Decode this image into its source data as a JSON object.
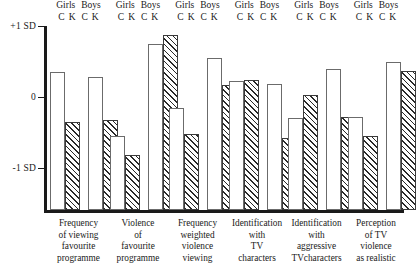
{
  "chart_data": {
    "type": "bar",
    "title": "",
    "xlabel": "",
    "ylabel": "",
    "ylim": [
      -1.6,
      1.0
    ],
    "grid": false,
    "legend_position": "top-per-group",
    "y_ticks": [
      {
        "value": 1,
        "label": "+1 SD"
      },
      {
        "value": 0,
        "label": "0"
      },
      {
        "value": -1,
        "label": "-1 SD"
      }
    ],
    "group_header_line1": [
      "Girls",
      "Boys"
    ],
    "group_header_line2": [
      "C",
      "K",
      "C",
      "K"
    ],
    "bar_labels": [
      "Girls C",
      "Girls K",
      "Boys C",
      "Boys K"
    ],
    "bar_styles": [
      "open",
      "hatched",
      "open",
      "hatched"
    ],
    "categories": [
      "Frequency of viewing favourite programme",
      "Violence of favourite programme",
      "Frequency weighted violence viewing",
      "Identification with TV characters",
      "Identification with aggressive TVcharacters",
      "Perception of TV violence as realistic"
    ],
    "category_lines": [
      [
        "Frequency",
        "of viewing",
        "favourite",
        "programme"
      ],
      [
        "Violence",
        "of",
        "favourite",
        "programme"
      ],
      [
        "Frequency",
        "weighted",
        "violence",
        "viewing"
      ],
      [
        "Identification",
        "with",
        "TV",
        "characters"
      ],
      [
        "Identification",
        "with",
        "aggressive",
        "TVcharacters"
      ],
      [
        "Perception",
        "of TV",
        "violence",
        "as realistic"
      ]
    ],
    "series": [
      {
        "name": "Girls C",
        "style": "open",
        "values": [
          0.35,
          -0.55,
          -0.15,
          0.22,
          -0.3,
          -0.28
        ]
      },
      {
        "name": "Girls K",
        "style": "hatched",
        "values": [
          -0.35,
          -0.82,
          -0.52,
          0.24,
          0.03,
          -0.55
        ]
      },
      {
        "name": "Boys C",
        "style": "open",
        "values": [
          0.28,
          0.75,
          0.55,
          0.18,
          0.4,
          0.5
        ]
      },
      {
        "name": "Boys K",
        "style": "hatched",
        "values": [
          -0.33,
          0.87,
          0.17,
          -0.58,
          -0.28,
          0.37
        ]
      }
    ]
  },
  "footer": {
    "partial_text": ""
  }
}
